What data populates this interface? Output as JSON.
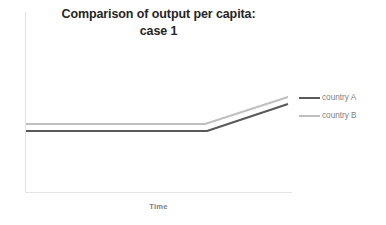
{
  "chart_data": {
    "type": "line",
    "title": "Comparison of output per capita: case 1",
    "title_lines": [
      "Comparison of output per capita:",
      "case 1"
    ],
    "xlabel": "Time",
    "ylabel": "",
    "grid": false,
    "legend_position": "right",
    "x": [
      0,
      0.68,
      1
    ],
    "xlim": [
      0,
      1
    ],
    "ylim": [
      0,
      1
    ],
    "axis_tick_labels": {
      "x": [],
      "y": []
    },
    "series": [
      {
        "name": "country A",
        "color": "#595959",
        "linewidth": 2,
        "values": [
          0.345,
          0.345,
          0.495
        ],
        "pixel_points": [
          {
            "x": 26,
            "y": 131
          },
          {
            "x": 207,
            "y": 131
          },
          {
            "x": 288,
            "y": 104
          }
        ]
      },
      {
        "name": "country B",
        "color": "#bfbfbf",
        "linewidth": 2,
        "values": [
          0.385,
          0.385,
          0.535
        ],
        "pixel_points": [
          {
            "x": 26,
            "y": 124
          },
          {
            "x": 205,
            "y": 124
          },
          {
            "x": 288,
            "y": 97
          }
        ]
      }
    ],
    "axes": {
      "color": "#e4e4e4",
      "y_axis": {
        "x": 25.5,
        "y_top": 12,
        "y_bottom": 192
      },
      "x_axis": {
        "y": 192.5,
        "x_left": 25,
        "x_right": 292
      }
    },
    "colors": {
      "background": "#ffffff",
      "title": "#262626",
      "legend_text": "#7f7f7f",
      "axis_title": "#808080",
      "axis_line": "#e4e4e4",
      "series_a": "#595959",
      "series_b": "#bfbfbf"
    }
  },
  "legend": {
    "entries": [
      {
        "label": "country A",
        "color": "#595959"
      },
      {
        "label": "country B",
        "color": "#bfbfbf"
      }
    ]
  }
}
